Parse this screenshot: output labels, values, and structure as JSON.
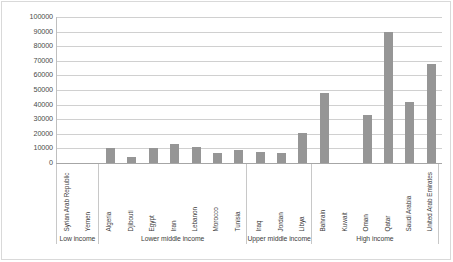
{
  "chart_data": {
    "type": "bar",
    "title": "",
    "subtitle": "",
    "xlabel": "",
    "ylabel": "",
    "ylim": [
      0,
      100000
    ],
    "y_ticks": [
      100000,
      90000,
      80000,
      70000,
      60000,
      50000,
      40000,
      30000,
      20000,
      10000,
      0
    ],
    "y_tick_labels": [
      "100000",
      "90000",
      "80000",
      "70000",
      "60000",
      "50000",
      "40000",
      "30000",
      "20000",
      "10000",
      "0"
    ],
    "grid": true,
    "legend": "none",
    "bar_color": "#969696",
    "categories": [
      "Syrian Arab Republic",
      "Yemen",
      "Algeria",
      "Djibouti",
      "Egypt",
      "Iran",
      "Lebanon",
      "Morocco",
      "Tunisia",
      "Iraq",
      "Jordan",
      "Libya",
      "Bahrain",
      "Kuwait",
      "Oman",
      "Qatar",
      "Saudi Arabia",
      "United Arab Emirates"
    ],
    "values": [
      0,
      0,
      10200,
      4000,
      10500,
      13000,
      11300,
      7000,
      8700,
      7500,
      7000,
      20500,
      48000,
      0,
      33000,
      90000,
      42000,
      67500
    ],
    "groups": [
      {
        "label": "Low income",
        "count": 2
      },
      {
        "label": "Lower middle income",
        "count": 7
      },
      {
        "label": "Upper middle income",
        "count": 3
      },
      {
        "label": "High income",
        "count": 6
      }
    ]
  }
}
